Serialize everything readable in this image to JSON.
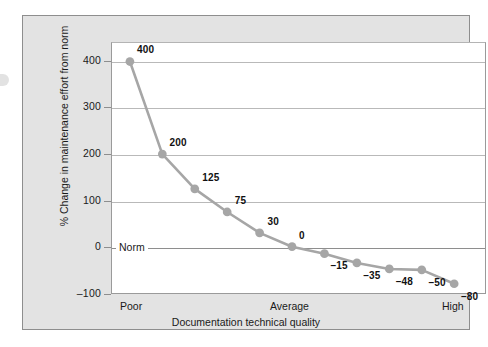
{
  "chart_data": {
    "type": "line",
    "title": "",
    "xlabel": "Documentation technical quality",
    "ylabel": "% Change in maintenance effort from norm",
    "categories": [
      "Poor",
      "",
      "",
      "",
      "",
      "Average",
      "",
      "",
      "",
      "",
      "High"
    ],
    "x_tick_labels": [
      "Poor",
      "Average",
      "High"
    ],
    "values": [
      400,
      200,
      125,
      75,
      30,
      0,
      -15,
      -35,
      -48,
      -50,
      -80
    ],
    "point_labels": [
      "400",
      "200",
      "125",
      "75",
      "30",
      "0",
      "–15",
      "–35",
      "–48",
      "–50",
      "–80"
    ],
    "ylim": [
      -100,
      440
    ],
    "y_ticks": [
      400,
      300,
      200,
      100,
      0,
      -100
    ],
    "y_tick_labels": [
      "400",
      "300",
      "200",
      "100",
      "0",
      "–100"
    ],
    "gridlines": [
      400,
      300,
      200,
      100,
      0
    ],
    "grid": true,
    "legend": "none",
    "baseline_label": "Norm",
    "series_color": "#a6a6a6",
    "marker_color": "#a6a6a6",
    "grid_color": "#b9b9b9",
    "axis_color": "#8e8e8e",
    "panel_color": "#e3e3e3",
    "plot_background": "#ffffff",
    "text_color": "#1a1a1a"
  }
}
